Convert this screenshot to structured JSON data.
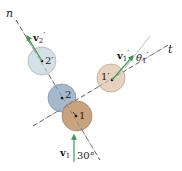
{
  "diagram": {
    "axes": {
      "n_label": "n",
      "t_label": "t"
    },
    "balls": [
      {
        "id": "ball-2-prime",
        "label": "2′",
        "cx": 42,
        "cy": 61,
        "r": 14,
        "fill": "#d3e1e6",
        "stroke": "#9fb0b6"
      },
      {
        "id": "ball-2",
        "label": "2",
        "cx": 62,
        "cy": 98,
        "r": 14,
        "fill": "#a5b9cc",
        "stroke": "#7e8fa0"
      },
      {
        "id": "ball-1",
        "label": "1",
        "cx": 77,
        "cy": 116,
        "r": 15,
        "fill": "#c9a27e",
        "stroke": "#9c7c5e"
      },
      {
        "id": "ball-1-prime",
        "label": "1′",
        "cx": 111,
        "cy": 78,
        "r": 14,
        "fill": "#e6d2bf",
        "stroke": "#b8a08a"
      }
    ],
    "vectors": {
      "v1": {
        "main": "v",
        "sub": "1",
        "prime": ""
      },
      "v1_prime": {
        "main": "v",
        "sub": "1",
        "prime": "′"
      },
      "v2_prime": {
        "main": "v",
        "sub": "2",
        "prime": "′"
      }
    },
    "angles": {
      "incoming": "30°",
      "theta_main": "θ",
      "theta_sub": "1",
      "theta_prime": "′"
    },
    "colors": {
      "arrow": "#3e9a52",
      "dash": "#555555"
    }
  }
}
